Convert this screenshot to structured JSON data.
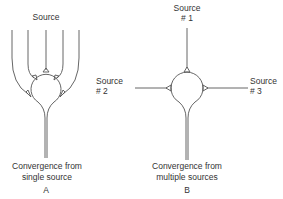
{
  "diagram": {
    "panel_a": {
      "source_label": "Source",
      "caption_line1": "Convergence from",
      "caption_line2": "single source",
      "panel_letter": "A"
    },
    "panel_b": {
      "source1_line1": "Source",
      "source1_line2": "# 1",
      "source2_line1": "Source",
      "source2_line2": "# 2",
      "source3_line1": "Source",
      "source3_line2": "# 3",
      "caption_line1": "Convergence from",
      "caption_line2": "multiple sources",
      "panel_letter": "B"
    },
    "colors": {
      "line": "#555555",
      "text": "#333333"
    }
  }
}
